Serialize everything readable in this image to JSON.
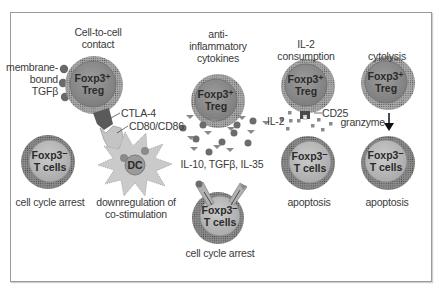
{
  "diagram": {
    "colors": {
      "treg_fill": "#8a8a8a",
      "treg_ring": "#b5b5b5",
      "tcell_fill": "#bdbdbd",
      "tcell_ring": "#8e8e8e",
      "dc_fill": "#c8c8c8",
      "dark": "#555555",
      "frame": "#9a9a9a"
    },
    "panels": [
      {
        "id": "cell-contact",
        "heading": "Cell-to-cell\ncontact",
        "side_label": "membrane-\nbound\nTGFβ",
        "treg_label": "Foxp3⁺\nTreg",
        "ctla4_label": "CTLA-4",
        "cd80_label": "CD80/CD86",
        "dc_label": "DC",
        "tcell_label": "Foxp3⁻\nT cells",
        "tcell_outcome": "cell cycle arrest",
        "dc_outcome": "downregulation of\nco-stimulation"
      },
      {
        "id": "cytokines",
        "heading": "anti-\ninflammatory\ncytokines",
        "treg_label": "Foxp3⁺\nTreg",
        "cytokine_label": "IL-10, TGFβ, IL-35",
        "tcell_label": "Foxp3⁻\nT cells",
        "outcome": "cell cycle arrest"
      },
      {
        "id": "il2-consumption",
        "heading": "IL-2\nconsumption",
        "treg_label": "Foxp3⁺\nTreg",
        "il2_label": "IL-2",
        "cd25_label": "CD25",
        "tcell_label": "Foxp3⁻\nT cells",
        "outcome": "apoptosis"
      },
      {
        "id": "cytolysis",
        "heading": "cytolysis",
        "treg_label": "Foxp3⁺\nTreg",
        "granzyme_label": "granzyme",
        "tcell_label": "Foxp3⁻\nT cells",
        "outcome": "apoptosis"
      }
    ]
  }
}
